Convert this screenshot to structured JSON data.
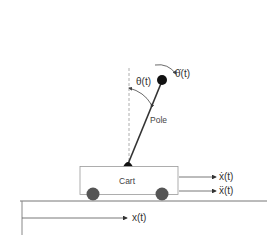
{
  "diagram": {
    "labels": {
      "theta": "θ(t)",
      "theta_dot": "θ̇(t)",
      "pole": "Pole",
      "cart": "Cart",
      "x_dot": "ẋ(t)",
      "x_ddot": "ẍ(t)",
      "x": "x(t)"
    },
    "colors": {
      "line": "#555555",
      "bob": "#111111",
      "wheel": "#555555",
      "ground": "#777777",
      "dashed": "#999999"
    }
  }
}
